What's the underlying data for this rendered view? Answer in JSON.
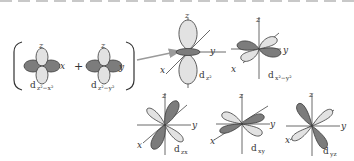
{
  "colors": {
    "light_lobe": "#e2e2e2",
    "dark_lobe": "#7c7c7c",
    "outline": "#3a3a3a",
    "axis": "#444444",
    "arrow": "#9a9a9a",
    "text": "#333333"
  },
  "combination": {
    "plus": "+",
    "left": {
      "axis_top": "z",
      "axis_side": "x",
      "label_main": "d",
      "label_sub": "z²−x²"
    },
    "right": {
      "axis_top": "z",
      "axis_side": "y",
      "label_main": "d",
      "label_sub": "z²−y²"
    }
  },
  "orbitals": [
    {
      "id": "dz2",
      "label_main": "d",
      "label_sub": "z²",
      "axes": [
        "z",
        "x",
        "y"
      ]
    },
    {
      "id": "dx2y2",
      "label_main": "d",
      "label_sub": "x²−y²",
      "axes": [
        "z",
        "x",
        "y"
      ]
    },
    {
      "id": "dzx",
      "label_main": "d",
      "label_sub": "zx",
      "axes": [
        "z",
        "x",
        "y"
      ]
    },
    {
      "id": "dxy",
      "label_main": "d",
      "label_sub": "xy",
      "axes": [
        "z",
        "x",
        "y"
      ]
    },
    {
      "id": "dyz",
      "label_main": "d",
      "label_sub": "yz",
      "axes": [
        "z",
        "x",
        "y"
      ]
    }
  ]
}
